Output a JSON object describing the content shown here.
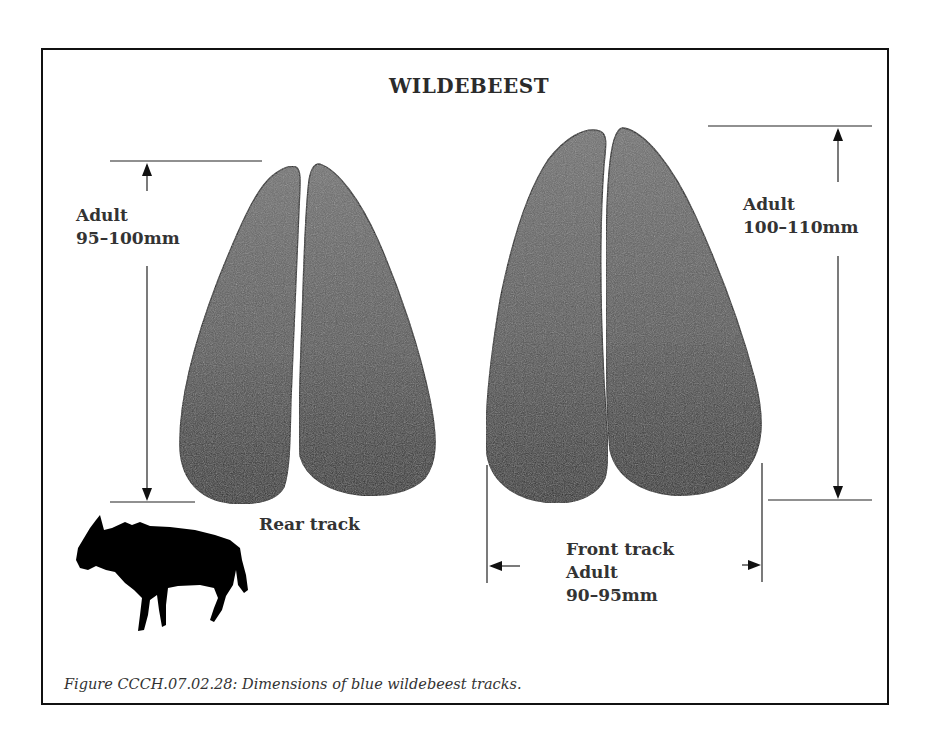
{
  "figure": {
    "title": "WILDEBEEST",
    "caption": "Figure CCCH.07.02.28:  Dimensions of blue wildebeest tracks."
  },
  "rear_track": {
    "label": "Rear track",
    "length_label": "Adult",
    "length_value": "95–100mm"
  },
  "front_track": {
    "label": "Front track",
    "length_label": "Adult",
    "length_value": "100–110mm",
    "width_label": "Adult",
    "width_value": "90–95mm"
  },
  "colors": {
    "track_fill_top": "#6a6a6a",
    "track_fill_bottom": "#2e2e2e",
    "outline": "#111111",
    "text": "#333333"
  },
  "icons": [
    "wildebeest-silhouette-icon",
    "arrow-up-icon",
    "arrow-down-icon",
    "arrow-left-icon",
    "arrow-right-icon"
  ]
}
